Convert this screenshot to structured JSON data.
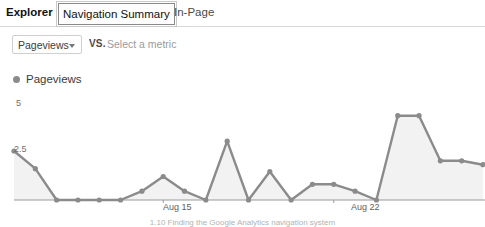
{
  "tabs": [
    {
      "id": "explorer",
      "label": "Explorer",
      "selected": false
    },
    {
      "id": "navigation",
      "label": "Navigation Summary",
      "selected": true
    },
    {
      "id": "inpage",
      "label": "In-Page",
      "selected": false
    }
  ],
  "metric_row": {
    "selected_metric": "Pageviews",
    "vs_label": "VS.",
    "compare_placeholder": "Select a metric",
    "caret_icon": "chevron-down-icon"
  },
  "legend": {
    "series_label": "Pageviews",
    "dot_color": "#8b8b8b"
  },
  "caption": {
    "text": "1.10  Finding the Google Analytics navigation system"
  },
  "colors": {
    "line": "#8b8b8b",
    "area": "#f2f2f2",
    "axis": "#9a9a9a",
    "tab_border": "#8a8a8a"
  },
  "chart_data": {
    "type": "line",
    "title": "Pageviews",
    "xlabel": "",
    "ylabel": "Pageviews",
    "ylim": [
      0,
      5
    ],
    "yticks": [
      0,
      2.5,
      5
    ],
    "ytick_labels": [
      "",
      "2.5",
      "5"
    ],
    "grid": false,
    "legend_position": "top-left",
    "series": [
      {
        "name": "Pageviews",
        "values": [
          2.5,
          1.6,
          0,
          0,
          0,
          0,
          0.45,
          1.2,
          0.45,
          0,
          3.0,
          0,
          1.45,
          0,
          0.8,
          0.8,
          0.45,
          0,
          4.3,
          4.3,
          2.0,
          2.0,
          1.8
        ]
      }
    ],
    "x": [
      "Aug 8",
      "Aug 9",
      "Aug 10",
      "Aug 11",
      "Aug 12",
      "Aug 13",
      "Aug 14",
      "Aug 15",
      "Aug 16",
      "Aug 17",
      "Aug 18",
      "Aug 19",
      "Aug 20",
      "Aug 21",
      "Aug 22",
      "Aug 23",
      "Aug 24",
      "Aug 25",
      "Aug 26",
      "Aug 27",
      "Aug 28",
      "Aug 29",
      "Aug 30"
    ],
    "xtick_labels": [
      "Aug 15",
      "Aug 22"
    ],
    "xtick_indices": [
      7,
      15
    ]
  }
}
